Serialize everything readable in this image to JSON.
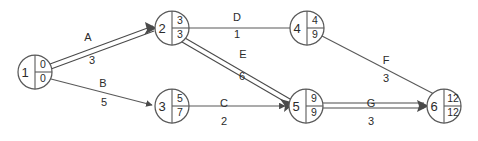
{
  "diagram": {
    "colors": {
      "background": "#ffffff",
      "stroke": "#595959",
      "critical_stroke": "#4a4a4a",
      "text": "#2b2b2b"
    },
    "nodes": [
      {
        "id": "1",
        "early": "0",
        "late": "0",
        "cx": 35,
        "cy": 72,
        "r": 17
      },
      {
        "id": "2",
        "early": "3",
        "late": "3",
        "cx": 172,
        "cy": 28,
        "r": 17
      },
      {
        "id": "3",
        "early": "5",
        "late": "7",
        "cx": 172,
        "cy": 106,
        "r": 17
      },
      {
        "id": "4",
        "early": "4",
        "late": "9",
        "cx": 307,
        "cy": 28,
        "r": 17
      },
      {
        "id": "5",
        "early": "9",
        "late": "9",
        "cx": 306,
        "cy": 106,
        "r": 17
      },
      {
        "id": "6",
        "early": "12",
        "late": "12",
        "cx": 444,
        "cy": 106,
        "r": 17
      }
    ],
    "edges": [
      {
        "name": "A",
        "duration": "3",
        "from": "1",
        "to": "2",
        "critical": true,
        "label_x": 88,
        "label_y": 41,
        "dur_x": 92,
        "dur_y": 64
      },
      {
        "name": "B",
        "duration": "5",
        "from": "1",
        "to": "3",
        "critical": false,
        "label_x": 103,
        "label_y": 87,
        "dur_x": 104,
        "dur_y": 106
      },
      {
        "name": "C",
        "duration": "2",
        "from": "3",
        "to": "5",
        "critical": false,
        "label_x": 224,
        "label_y": 107,
        "dur_x": 224,
        "dur_y": 125
      },
      {
        "name": "D",
        "duration": "1",
        "from": "2",
        "to": "4",
        "critical": false,
        "label_x": 237,
        "label_y": 21,
        "dur_x": 237,
        "dur_y": 38
      },
      {
        "name": "E",
        "duration": "6",
        "from": "2",
        "to": "5",
        "critical": true,
        "label_x": 243,
        "label_y": 58,
        "dur_x": 242,
        "dur_y": 80
      },
      {
        "name": "F",
        "duration": "3",
        "from": "4",
        "to": "6",
        "critical": false,
        "label_x": 386,
        "label_y": 64,
        "dur_x": 386,
        "dur_y": 82
      },
      {
        "name": "G",
        "duration": "3",
        "from": "5",
        "to": "6",
        "critical": true,
        "label_x": 371,
        "label_y": 107,
        "dur_x": 371,
        "dur_y": 125
      }
    ]
  }
}
